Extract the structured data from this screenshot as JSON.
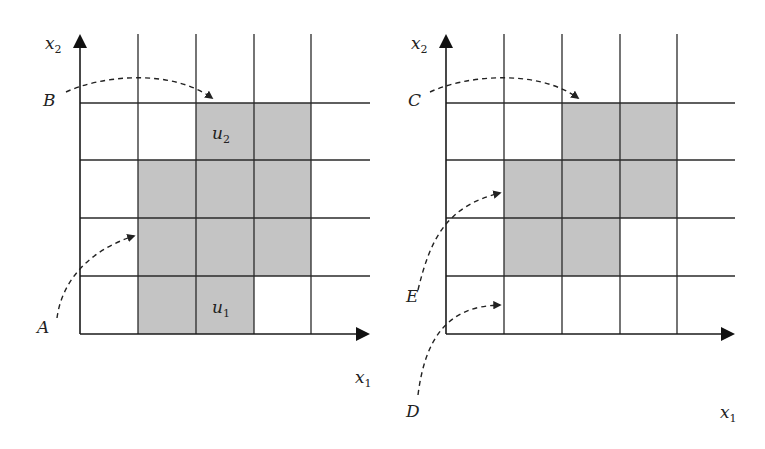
{
  "figure": {
    "left_panel": {
      "axis_x_label": "x",
      "axis_x_sub": "1",
      "axis_y_label": "x",
      "axis_y_sub": "2",
      "cell_labels": [
        {
          "name": "u",
          "sub": "2"
        },
        {
          "name": "u",
          "sub": "1"
        }
      ],
      "point_labels": [
        "B",
        "A"
      ]
    },
    "right_panel": {
      "axis_x_label": "x",
      "axis_x_sub": "1",
      "axis_y_label": "x",
      "axis_y_sub": "2",
      "point_labels": [
        "C",
        "E",
        "D"
      ]
    },
    "colors": {
      "shaded_cell": "#c4c4c4",
      "grid_line": "#2a2a2a",
      "background": "#ffffff"
    }
  }
}
